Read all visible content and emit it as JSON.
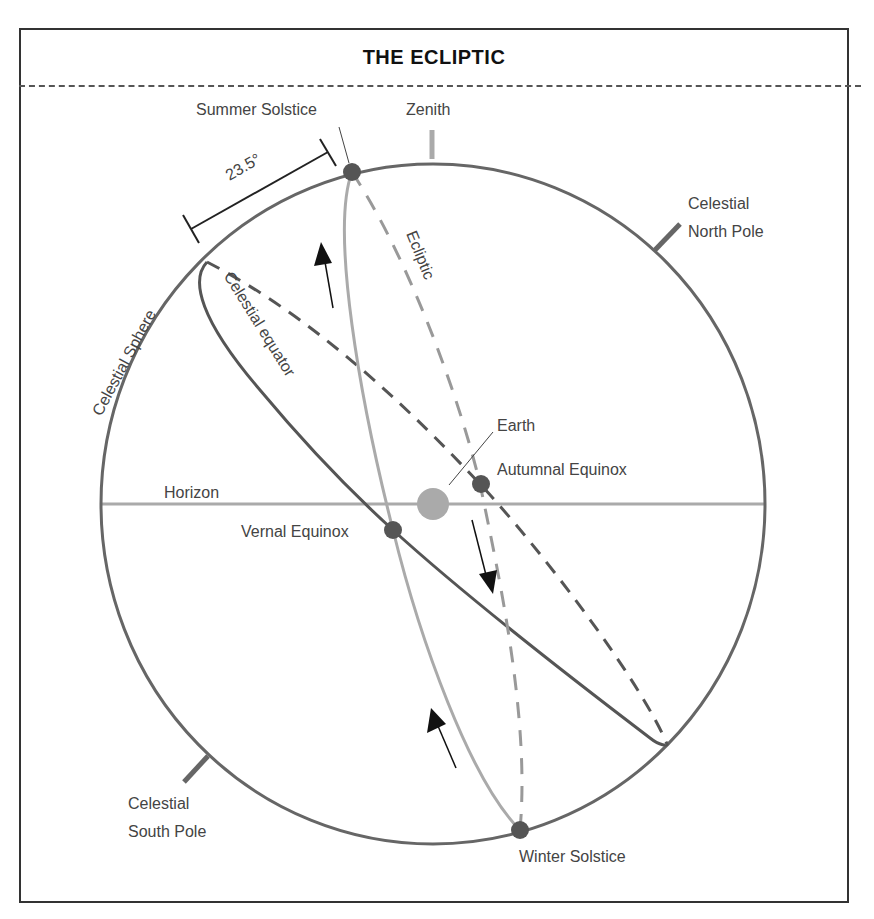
{
  "title": "THE ECLIPTIC",
  "labels": {
    "summer_solstice": "Summer Solstice",
    "zenith": "Zenith",
    "angle": "23.5°",
    "north_pole_1": "Celestial",
    "north_pole_2": "North Pole",
    "celestial_sphere": "Celestial Sphere",
    "celestial_equator": "Celestial equator",
    "ecliptic": "Ecliptic",
    "earth": "Earth",
    "autumnal_equinox": "Autumnal Equinox",
    "horizon": "Horizon",
    "vernal_equinox": "Vernal Equinox",
    "south_pole_1": "Celestial",
    "south_pole_2": "South Pole",
    "winter_solstice": "Winter Solstice"
  },
  "colors": {
    "sphere": "#666666",
    "equator": "#555555",
    "ecliptic": "#999999",
    "horizon": "#aaaaaa",
    "earth": "#aaaaaa",
    "points": "#555555",
    "arrows": "#111111"
  }
}
